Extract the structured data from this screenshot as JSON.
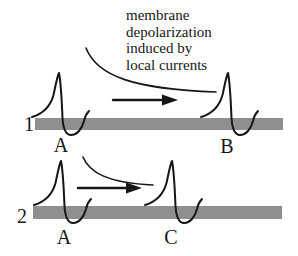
{
  "annotation": {
    "text": "membrane depolarization induced by local currents",
    "lines": [
      "membrane",
      "depolarization",
      "induced by",
      "local currents"
    ]
  },
  "panels": [
    {
      "index_label": "1",
      "left_site": "A",
      "right_site": "B"
    },
    {
      "index_label": "2",
      "left_site": "A",
      "right_site": "C"
    }
  ],
  "icons": {
    "propagation_arrow": "right-arrow-icon",
    "local_currents_pointer": "curved-sweep-line",
    "action_potential": "spike-waveform"
  },
  "colors": {
    "axon_bar": "#8f8f8f",
    "ink": "#161616",
    "background": "#ffffff"
  }
}
